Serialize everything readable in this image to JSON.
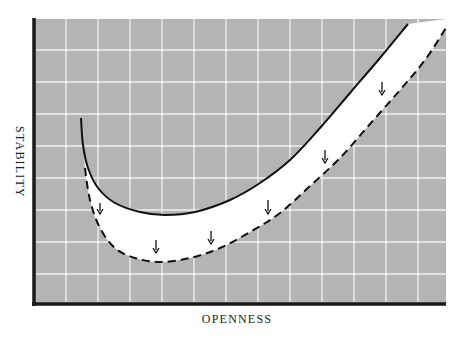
{
  "chart_data": {
    "type": "line",
    "title": "",
    "xlabel": "OPENNESS",
    "ylabel": "STABILITY",
    "grid": true,
    "legend": null,
    "x_ticks": [],
    "y_ticks": [],
    "colors": {
      "plot_background": "#b4b4b4",
      "grid": "#f2f2f2",
      "band_fill": "#ffffff",
      "axis": "#1a1a1a",
      "curve": "#111111"
    },
    "series": [
      {
        "name": "current-curve",
        "style": "solid",
        "points": [
          [
            81,
            118
          ],
          [
            83,
            145
          ],
          [
            88,
            168
          ],
          [
            98,
            188
          ],
          [
            115,
            203
          ],
          [
            140,
            212
          ],
          [
            165,
            215
          ],
          [
            195,
            212
          ],
          [
            230,
            200
          ],
          [
            260,
            183
          ],
          [
            290,
            160
          ],
          [
            320,
            128
          ],
          [
            350,
            93
          ],
          [
            380,
            58
          ],
          [
            408,
            24
          ]
        ]
      },
      {
        "name": "shifted-curve",
        "style": "dashed",
        "points": [
          [
            85,
            168
          ],
          [
            90,
            200
          ],
          [
            100,
            228
          ],
          [
            115,
            248
          ],
          [
            135,
            258
          ],
          [
            160,
            262
          ],
          [
            190,
            258
          ],
          [
            220,
            248
          ],
          [
            250,
            232
          ],
          [
            280,
            213
          ],
          [
            310,
            186
          ],
          [
            340,
            158
          ],
          [
            370,
            124
          ],
          [
            400,
            90
          ],
          [
            425,
            60
          ],
          [
            446,
            28
          ]
        ]
      }
    ],
    "annotations": [
      {
        "type": "arrow-down",
        "x": 100,
        "y1": 203,
        "y2": 214
      },
      {
        "type": "arrow-down",
        "x": 156,
        "y1": 240,
        "y2": 253
      },
      {
        "type": "arrow-down",
        "x": 211,
        "y1": 231,
        "y2": 244
      },
      {
        "type": "arrow-down",
        "x": 268,
        "y1": 200,
        "y2": 214
      },
      {
        "type": "arrow-down",
        "x": 325,
        "y1": 150,
        "y2": 163
      },
      {
        "type": "arrow-down",
        "x": 382,
        "y1": 82,
        "y2": 95
      }
    ],
    "plot_area": {
      "x0": 34,
      "y0": 19,
      "x1": 446,
      "y1": 304
    },
    "grid_x": [
      66,
      98,
      130,
      162,
      194,
      226,
      258,
      290,
      322,
      354,
      386,
      418
    ],
    "grid_y": [
      50,
      82,
      114,
      146,
      178,
      210,
      242,
      274
    ]
  }
}
